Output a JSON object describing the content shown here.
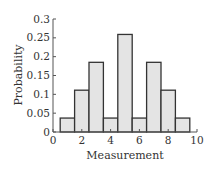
{
  "chart_data": {
    "type": "bar",
    "title": "",
    "xlabel": "Measurement",
    "ylabel": "Probability",
    "categories": [
      1,
      2,
      3,
      4,
      5,
      6,
      7,
      8,
      9
    ],
    "values": [
      0.037,
      0.111,
      0.185,
      0.037,
      0.259,
      0.037,
      0.185,
      0.111,
      0.037
    ],
    "bar_width": 1,
    "xlim": [
      0,
      10
    ],
    "ylim": [
      0,
      0.3
    ],
    "xticks": [
      0,
      2,
      4,
      6,
      8,
      10
    ],
    "xtick_labels": [
      "0",
      "2",
      "4",
      "6",
      "8",
      "10"
    ],
    "yticks": [
      0,
      0.05,
      0.1,
      0.15,
      0.2,
      0.25,
      0.3
    ],
    "ytick_labels": [
      "0",
      "0.05",
      "0.1",
      "0.15",
      "0.2",
      "0.25",
      "0.3"
    ],
    "grid": false,
    "legend": null,
    "colors": {
      "bar_fill": "#e4e4e4",
      "bar_edge": "#333333",
      "axis": "#555555"
    }
  }
}
